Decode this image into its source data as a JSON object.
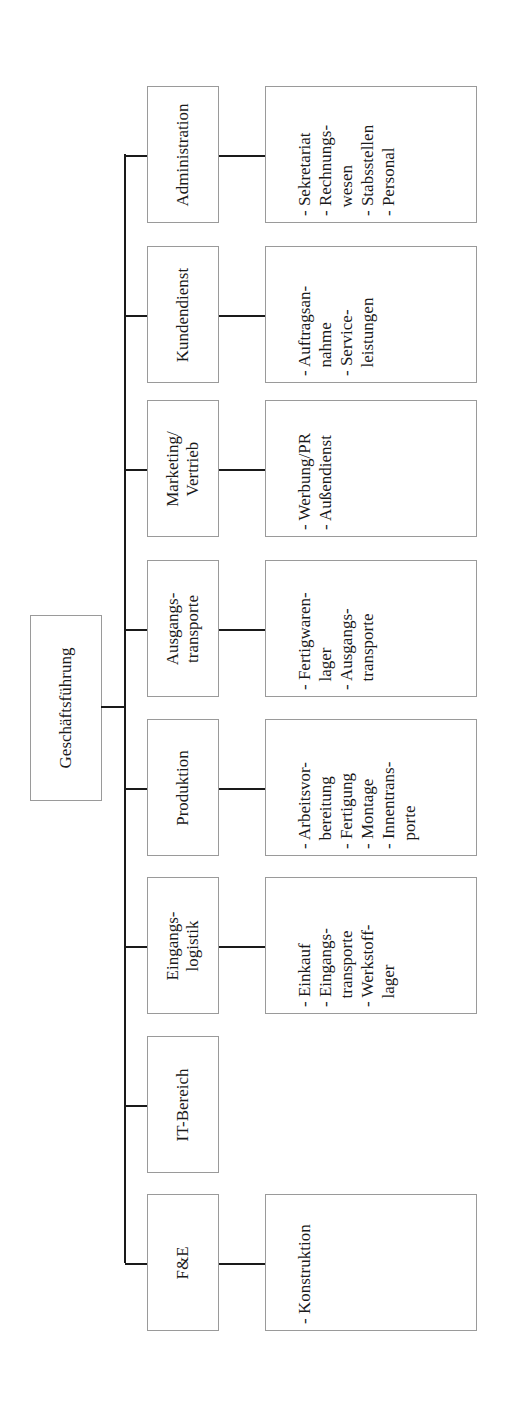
{
  "root": {
    "label": "Geschäftsführung"
  },
  "departments": [
    {
      "label_lines": [
        "Administration"
      ],
      "items": [
        "- Sekretariat",
        "- Rechnungs-",
        "  wesen",
        "- Stabsstellen",
        "- Personal"
      ]
    },
    {
      "label_lines": [
        "Kundendienst"
      ],
      "items": [
        "- Auftragsan-",
        "  nahme",
        "- Service-",
        "  leistungen"
      ]
    },
    {
      "label_lines": [
        "Marketing/",
        "Vertrieb"
      ],
      "items": [
        "- Werbung/PR",
        "- Außendienst"
      ]
    },
    {
      "label_lines": [
        "Ausgangs-",
        "transporte"
      ],
      "items": [
        "- Fertigwaren-",
        "  lager",
        "- Ausgangs-",
        "  transporte"
      ]
    },
    {
      "label_lines": [
        "Produktion"
      ],
      "items": [
        "- Arbeitsvor-",
        "  bereitung",
        "- Fertigung",
        "- Montage",
        "- Innentrans-",
        "  porte"
      ]
    },
    {
      "label_lines": [
        "Eingangs-",
        "logistik"
      ],
      "items": [
        "- Einkauf",
        "- Eingangs-",
        "  transporte",
        "- Werkstoff-",
        "  lager"
      ]
    },
    {
      "label_lines": [
        "IT-Bereich"
      ],
      "items": []
    },
    {
      "label_lines": [
        "F&E"
      ],
      "items": [
        "- Konstruktion"
      ]
    }
  ]
}
